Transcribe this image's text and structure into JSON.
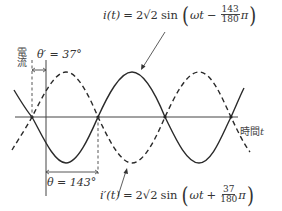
{
  "diagram": {
    "type": "sinusoid-phase-diagram",
    "axes": {
      "y_label": "電流",
      "x_label_text": "時間",
      "x_label_var": "t"
    },
    "curves": [
      {
        "name": "i(t)",
        "style": "solid",
        "label_lhs": "i(t)",
        "amplitude": "2√2",
        "sign": "−",
        "phase_num": "143",
        "phase_den": "180",
        "phase_unit": "π"
      },
      {
        "name": "i'(t)",
        "style": "dashed",
        "label_lhs": "i′(t)",
        "amplitude": "2√2",
        "sign": "+",
        "phase_num": "37",
        "phase_den": "180",
        "phase_unit": "π"
      }
    ],
    "angles": {
      "theta_prime": "θ′ = 37°",
      "theta": "θ = 143°"
    },
    "equation_parts": {
      "equals": "=",
      "sin": "sin",
      "omega_t": "ωt",
      "lparen": "(",
      "rparen": ")"
    },
    "colors": {
      "line": "#2a2a2a",
      "axis": "#444444",
      "background": "#ffffff"
    }
  }
}
